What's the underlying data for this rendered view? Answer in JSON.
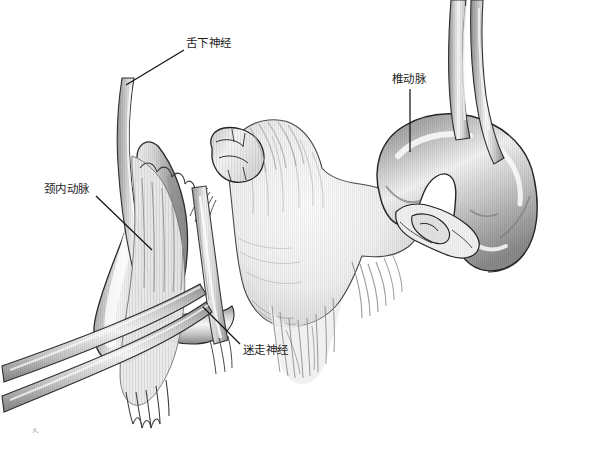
{
  "figure": {
    "style": "grayscale pen-and-ink medical illustration",
    "background_color": "#ffffff",
    "width": 607,
    "height": 449
  },
  "palette": {
    "ink": "#1d1d1d",
    "vessel_dark": "#7d7d7d",
    "vessel_mid": "#a9a9a9",
    "vessel_light": "#e8e8e8",
    "vessel_highlight": "#fbfbfb",
    "bone_light": "#f2f2f2",
    "bone_shadow": "#c9c9c9",
    "outline": "#2b2b2b",
    "leader_line": "#141414",
    "label_text": "#1d1d1d"
  },
  "labels": [
    {
      "id": "hypoglossal-nerve",
      "text": "舌下神经",
      "romanization": "she xia shen jing",
      "english": "hypoglossal nerve",
      "x": 186,
      "y": 37,
      "leader": {
        "x1": 184,
        "y1": 50,
        "x2": 126,
        "y2": 85
      }
    },
    {
      "id": "internal-carotid-artery",
      "text": "颈内动脉",
      "romanization": "jing nei dong mai",
      "english": "internal carotid artery",
      "x": 44,
      "y": 183,
      "leader": {
        "x1": 96,
        "y1": 196,
        "x2": 152,
        "y2": 250
      }
    },
    {
      "id": "vertebral-artery",
      "text": "椎动脉",
      "romanization": "zhui dong mai",
      "english": "vertebral artery",
      "x": 392,
      "y": 73,
      "leader": {
        "x1": 410,
        "y1": 89,
        "x2": 410,
        "y2": 152
      }
    },
    {
      "id": "vagus-nerve",
      "text": "迷走神经",
      "romanization": "mi zou shen jing",
      "english": "vagus nerve",
      "x": 243,
      "y": 344,
      "leader": {
        "x1": 240,
        "y1": 344,
        "x2": 203,
        "y2": 307
      }
    }
  ],
  "structures": [
    {
      "id": "hypoglossal-nerve-trunk",
      "name": "hypoglossal nerve trunk",
      "region": "upper-left"
    },
    {
      "id": "internal-carotid-artery-body",
      "name": "internal carotid artery",
      "region": "left"
    },
    {
      "id": "vagus-nerve-trunk",
      "name": "vagus nerve trunk",
      "region": "left-center"
    },
    {
      "id": "vertebral-artery-loop",
      "name": "tortuous vertebral artery loop",
      "region": "right"
    },
    {
      "id": "vertebral-body",
      "name": "vertebral body with transverse process",
      "region": "center"
    },
    {
      "id": "fibrous-attachments",
      "name": "fibrous / muscular attachments",
      "region": "center-lower"
    },
    {
      "id": "crossing-vessels",
      "name": "crossing vessel branches",
      "region": "lower-left"
    },
    {
      "id": "transverse-foramen-detail",
      "name": "transverse foramen detail",
      "region": "center-right"
    }
  ]
}
